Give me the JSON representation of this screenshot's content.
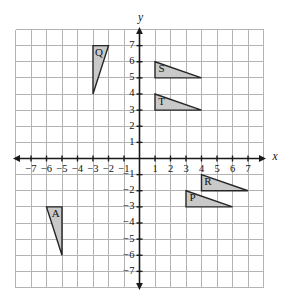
{
  "figure": {
    "background_color": "#ffffff",
    "grid_color": "#b3b3b3",
    "axis_color": "#1a1a1a",
    "shape_fill_color": "#c9c9c9",
    "shape_stroke_color": "#262626"
  },
  "axes": {
    "x_label": "x",
    "y_label": "y",
    "x_min": -8,
    "x_max": 8,
    "y_min": -8,
    "y_max": 8,
    "x_tick_labels": [
      "−7",
      "−6",
      "−5",
      "−4",
      "−3",
      "−2",
      "−1",
      "1",
      "2",
      "3",
      "4",
      "5",
      "6",
      "7"
    ],
    "x_tick_values": [
      -7,
      -6,
      -5,
      -4,
      -3,
      -2,
      -1,
      1,
      2,
      3,
      4,
      5,
      6,
      7
    ],
    "y_tick_labels": [
      "7",
      "6",
      "5",
      "4",
      "3",
      "2",
      "1",
      "−1",
      "−2",
      "−3",
      "−4",
      "−5",
      "−6",
      "−7"
    ],
    "y_tick_values": [
      7,
      6,
      5,
      4,
      3,
      2,
      1,
      -1,
      -2,
      -3,
      -4,
      -5,
      -6,
      -7
    ],
    "grid": true,
    "grid_spacing": 1
  },
  "chart_data": {
    "type": "scatter",
    "title": "",
    "xlabel": "x",
    "ylabel": "y",
    "xlim": [
      -8,
      8
    ],
    "ylim": [
      -8,
      8
    ],
    "shapes": [
      {
        "label": "Q",
        "vertices": [
          [
            -3,
            7
          ],
          [
            -2,
            7
          ],
          [
            -3,
            4
          ]
        ],
        "label_position": [
          -2.62,
          6.5
        ]
      },
      {
        "label": "S",
        "vertices": [
          [
            1,
            6
          ],
          [
            4,
            5
          ],
          [
            1,
            5
          ]
        ],
        "label_position": [
          1.42,
          5.5
        ]
      },
      {
        "label": "T",
        "vertices": [
          [
            1,
            4
          ],
          [
            4,
            3
          ],
          [
            1,
            3
          ]
        ],
        "label_position": [
          1.42,
          3.5
        ]
      },
      {
        "label": "R",
        "vertices": [
          [
            4,
            -1
          ],
          [
            7,
            -2
          ],
          [
            4,
            -2
          ]
        ],
        "label_position": [
          4.42,
          -1.5
        ]
      },
      {
        "label": "P",
        "vertices": [
          [
            3,
            -2
          ],
          [
            6,
            -3
          ],
          [
            3,
            -3
          ]
        ],
        "label_position": [
          3.42,
          -2.5
        ]
      },
      {
        "label": "A",
        "vertices": [
          [
            -6,
            -3
          ],
          [
            -5,
            -3
          ],
          [
            -5,
            -6
          ]
        ],
        "label_position": [
          -5.4,
          -3.5
        ]
      }
    ]
  }
}
